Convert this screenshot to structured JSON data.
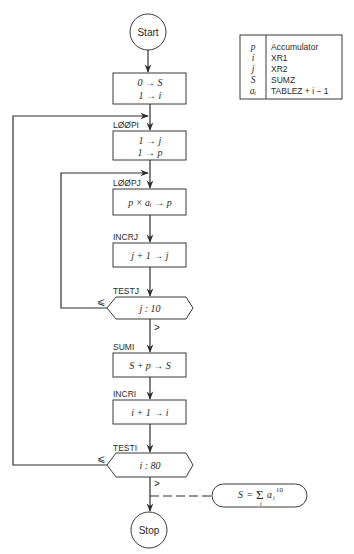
{
  "diagram": {
    "type": "flowchart",
    "title": "",
    "terminals": {
      "start": "Start",
      "stop": "Stop"
    },
    "nodes": [
      {
        "id": "init",
        "label": "",
        "lines": [
          "0 → S",
          "1 → i"
        ]
      },
      {
        "id": "loopi",
        "label": "LØØPI",
        "lines": [
          "1 → j",
          "1 → p"
        ]
      },
      {
        "id": "loopj",
        "label": "LØØPJ",
        "lines": [
          "p × aᵢ → p"
        ]
      },
      {
        "id": "incrj",
        "label": "INCRJ",
        "lines": [
          "j + 1 → j"
        ]
      },
      {
        "id": "testj",
        "label": "TESTJ",
        "lines": [
          "j : 10"
        ],
        "shape": "hexagon",
        "branch_le": "⩽",
        "branch_gt": ">"
      },
      {
        "id": "sumi",
        "label": "SUMI",
        "lines": [
          "S + p → S"
        ]
      },
      {
        "id": "incri",
        "label": "INCRI",
        "lines": [
          "i + 1 → i"
        ]
      },
      {
        "id": "testi",
        "label": "TESTI",
        "lines": [
          "i : 80"
        ],
        "shape": "hexagon",
        "branch_le": "⩽",
        "branch_gt": ">"
      }
    ],
    "annotation": {
      "lhs": "S",
      "eq": "=",
      "sigma": "Σ",
      "sigma_sub": "i",
      "term": "a",
      "term_sub": "i",
      "term_sup": "10"
    },
    "legend": [
      {
        "symbol": "p",
        "meaning": "Accumulator"
      },
      {
        "symbol": "i",
        "meaning": "XR1"
      },
      {
        "symbol": "j",
        "meaning": "XR2"
      },
      {
        "symbol": "S",
        "meaning": "SUMZ"
      },
      {
        "symbol": "aᵢ",
        "meaning": "TABLEZ + i − 1"
      }
    ]
  },
  "colors": {
    "line": "#2e2e2e",
    "background": "#ffffff",
    "text": "#2a2a2a"
  }
}
